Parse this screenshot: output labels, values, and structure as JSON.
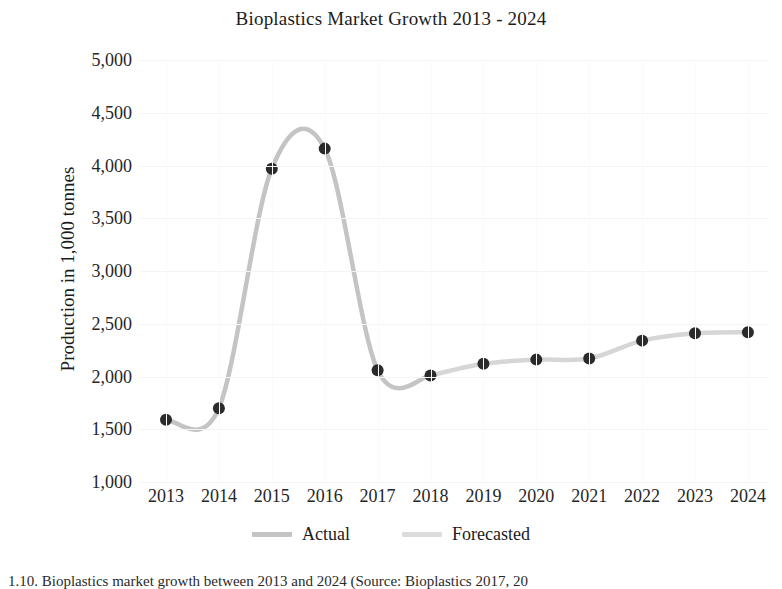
{
  "chart_data": {
    "type": "line",
    "title": "Bioplastics Market Growth 2013 - 2024",
    "xlabel": "",
    "ylabel": "Production in 1,000 tonnes",
    "categories": [
      "2013",
      "2014",
      "2015",
      "2016",
      "2017",
      "2018",
      "2019",
      "2020",
      "2021",
      "2022",
      "2023",
      "2024"
    ],
    "ylim": [
      1000,
      5000
    ],
    "yticks": [
      "1,000",
      "1,500",
      "2,000",
      "2,500",
      "3,000",
      "3,500",
      "4,000",
      "4,500",
      "5,000"
    ],
    "ytick_values": [
      1000,
      1500,
      2000,
      2500,
      3000,
      3500,
      4000,
      4500,
      5000
    ],
    "grid": true,
    "legend_position": "bottom",
    "marker": "circle",
    "marker_color": "#2b2b2b",
    "smoothing": "spline",
    "series": [
      {
        "name": "Actual",
        "color": "#c4c4c4",
        "x": [
          "2013",
          "2014",
          "2015",
          "2016",
          "2017",
          "2018"
        ],
        "values": [
          1590,
          1700,
          3970,
          4160,
          2060,
          2010
        ]
      },
      {
        "name": "Forecasted",
        "color": "#d6d6d6",
        "x": [
          "2018",
          "2019",
          "2020",
          "2021",
          "2022",
          "2023",
          "2024"
        ],
        "values": [
          2010,
          2120,
          2160,
          2170,
          2340,
          2410,
          2420
        ]
      }
    ],
    "points": [
      {
        "year": "2013",
        "value": 1590
      },
      {
        "year": "2014",
        "value": 1700
      },
      {
        "year": "2015",
        "value": 3970
      },
      {
        "year": "2016",
        "value": 4160
      },
      {
        "year": "2017",
        "value": 2060
      },
      {
        "year": "2018",
        "value": 2010
      },
      {
        "year": "2019",
        "value": 2120
      },
      {
        "year": "2020",
        "value": 2160
      },
      {
        "year": "2021",
        "value": 2170
      },
      {
        "year": "2022",
        "value": 2340
      },
      {
        "year": "2023",
        "value": 2410
      },
      {
        "year": "2024",
        "value": 2420
      }
    ]
  },
  "legend": {
    "items": [
      {
        "label": "Actual",
        "color": "#c4c4c4"
      },
      {
        "label": "Forecasted",
        "color": "#dcdcdc"
      }
    ]
  },
  "caption": {
    "text": "1.10. Bioplastics market growth between 2013 and 2024 (Source: Bioplastics 2017, 20"
  }
}
